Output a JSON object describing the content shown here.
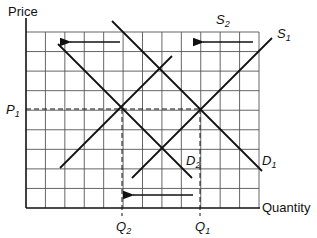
{
  "axes": {
    "y_label": "Price",
    "x_label": "Quantity"
  },
  "grid": {
    "columns": 12,
    "rows": 9
  },
  "curves": [
    {
      "id": "S1",
      "letter": "S",
      "sub": "1",
      "type": "supply"
    },
    {
      "id": "S2",
      "letter": "S",
      "sub": "2",
      "type": "supply"
    },
    {
      "id": "D1",
      "letter": "D",
      "sub": "1",
      "type": "demand"
    },
    {
      "id": "D2",
      "letter": "D",
      "sub": "2",
      "type": "demand"
    }
  ],
  "markers": {
    "p1": {
      "letter": "P",
      "sub": "1"
    },
    "q1": {
      "letter": "Q",
      "sub": "1"
    },
    "q2": {
      "letter": "Q",
      "sub": "2"
    }
  },
  "arrows": [
    {
      "id": "supply-shift",
      "direction": "left"
    },
    {
      "id": "demand-shift",
      "direction": "left"
    },
    {
      "id": "quantity-shift",
      "direction": "left"
    }
  ]
}
